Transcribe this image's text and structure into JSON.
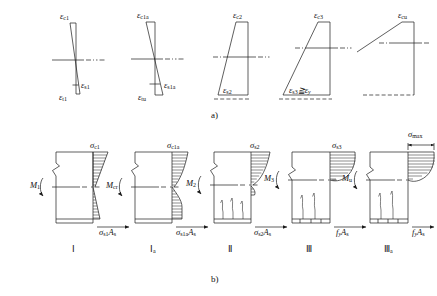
{
  "figure": {
    "captions": {
      "top": "a)",
      "bottom": "b)"
    },
    "colors": {
      "line": "#1a1a1a",
      "background": "#ffffff"
    }
  },
  "strain_diagrams": {
    "section_label": "a)",
    "items": [
      {
        "id": "stage-1",
        "top_label": "ε",
        "top_sub": "c1",
        "bottom_label": "ε",
        "bottom_sub": "s1",
        "extra_label": "ε",
        "extra_sub": "t1"
      },
      {
        "id": "stage-1a",
        "top_label": "ε",
        "top_sub": "c1a",
        "bottom_label": "ε",
        "bottom_sub": "s1a",
        "extra_label": "ε",
        "extra_sub": "tu"
      },
      {
        "id": "stage-2",
        "top_label": "ε",
        "top_sub": "c2",
        "bottom_label": "ε",
        "bottom_sub": "s2",
        "extra_label": "",
        "extra_sub": ""
      },
      {
        "id": "stage-3",
        "top_label": "ε",
        "top_sub": "c3",
        "bottom_label": "ε",
        "bottom_sub": "s3",
        "relation": "≧",
        "compare_label": "ε",
        "compare_sub": "y"
      },
      {
        "id": "stage-3a",
        "top_label": "ε",
        "top_sub": "cu",
        "bottom_label": "",
        "bottom_sub": ""
      }
    ]
  },
  "stress_diagrams": {
    "section_label": "b)",
    "items": [
      {
        "id": "stress-1",
        "roman": "Ⅰ",
        "roman_sub": "",
        "moment": "M",
        "moment_sub": "1",
        "concrete_stress": "σ",
        "concrete_sub": "c1",
        "steel_force": "σ",
        "steel_sub": "s1",
        "steel_area": "A",
        "steel_area_sub": "s"
      },
      {
        "id": "stress-1a",
        "roman": "Ⅰ",
        "roman_sub": "a",
        "moment": "M",
        "moment_sub": "cr",
        "concrete_stress": "σ",
        "concrete_sub": "c1a",
        "steel_force": "σ",
        "steel_sub": "s1a",
        "steel_area": "A",
        "steel_area_sub": "s"
      },
      {
        "id": "stress-2",
        "roman": "Ⅱ",
        "roman_sub": "",
        "moment": "M",
        "moment_sub": "2",
        "concrete_stress": "σ",
        "concrete_sub": "s2",
        "steel_force": "σ",
        "steel_sub": "s2",
        "steel_area": "A",
        "steel_area_sub": "s"
      },
      {
        "id": "stress-3",
        "roman": "Ⅲ",
        "roman_sub": "",
        "moment": "M",
        "moment_sub": "3",
        "concrete_stress": "σ",
        "concrete_sub": "s3",
        "steel_force": "f",
        "steel_sub": "y",
        "steel_area": "A",
        "steel_area_sub": "s"
      },
      {
        "id": "stress-3a",
        "roman": "Ⅲ",
        "roman_sub": "a",
        "moment": "M",
        "moment_sub": "u",
        "concrete_stress": "σ",
        "concrete_sub": "max",
        "steel_force": "f",
        "steel_sub": "y",
        "steel_area": "A",
        "steel_area_sub": "s"
      }
    ]
  }
}
